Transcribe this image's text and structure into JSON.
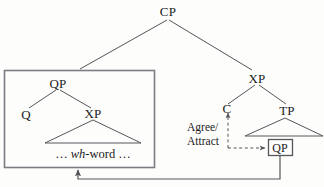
{
  "diagram": {
    "type": "syntax-tree",
    "colors": {
      "line": "#55565a",
      "text": "#1b1b1b",
      "box_border": "#7b7d80",
      "background": "#fdfdfc"
    },
    "nodes": {
      "cp": "CP",
      "qp_left": "QP",
      "q": "Q",
      "xp_left": "XP",
      "xp_right": "XP",
      "c": "C",
      "tp": "TP",
      "qp_moved": "QP"
    },
    "terminal": {
      "prefix": "… ",
      "italic": "wh",
      "suffix": "-word …",
      "full": "… wh-word …"
    },
    "operation": {
      "line1": "Agree/",
      "line2": "Attract"
    },
    "arrows": {
      "agree_attract_vertical": "dashed-arrow-up-to-C",
      "agree_attract_horizontal": "dashed-arrow-right-to-QP",
      "movement": "solid-arrow-up-to-left-box"
    }
  }
}
